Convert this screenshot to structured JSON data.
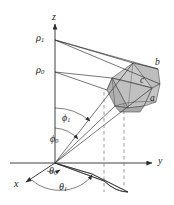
{
  "figure": {
    "type": "spherical-coordinate-volume-element-diagram",
    "background_color": "#ffffff",
    "line_color": "#2b2b2b",
    "dash_color": "#6e6e6e",
    "solid_fill_light": "#d2d2d2",
    "solid_fill_mid": "#bdbdbd",
    "solid_fill_dark": "#a8a8a8",
    "width": 174,
    "height": 205
  },
  "axes": {
    "z": {
      "label": "z",
      "sub": ""
    },
    "y": {
      "label": "y",
      "sub": ""
    },
    "x": {
      "label": "x",
      "sub": ""
    }
  },
  "radii": [
    {
      "label": "ρ",
      "sub": "1"
    },
    {
      "label": "ρ",
      "sub": "0"
    }
  ],
  "polar_angles": [
    {
      "label": "ϕ",
      "sub": "1"
    },
    {
      "label": "ϕ",
      "sub": "0"
    }
  ],
  "azimuth_angles": [
    {
      "label": "θ",
      "sub": "0"
    },
    {
      "label": "θ",
      "sub": "1"
    }
  ],
  "solid_faces": [
    {
      "label": "a",
      "sub": ""
    },
    {
      "label": "b",
      "sub": ""
    },
    {
      "label": "c",
      "sub": ""
    }
  ]
}
